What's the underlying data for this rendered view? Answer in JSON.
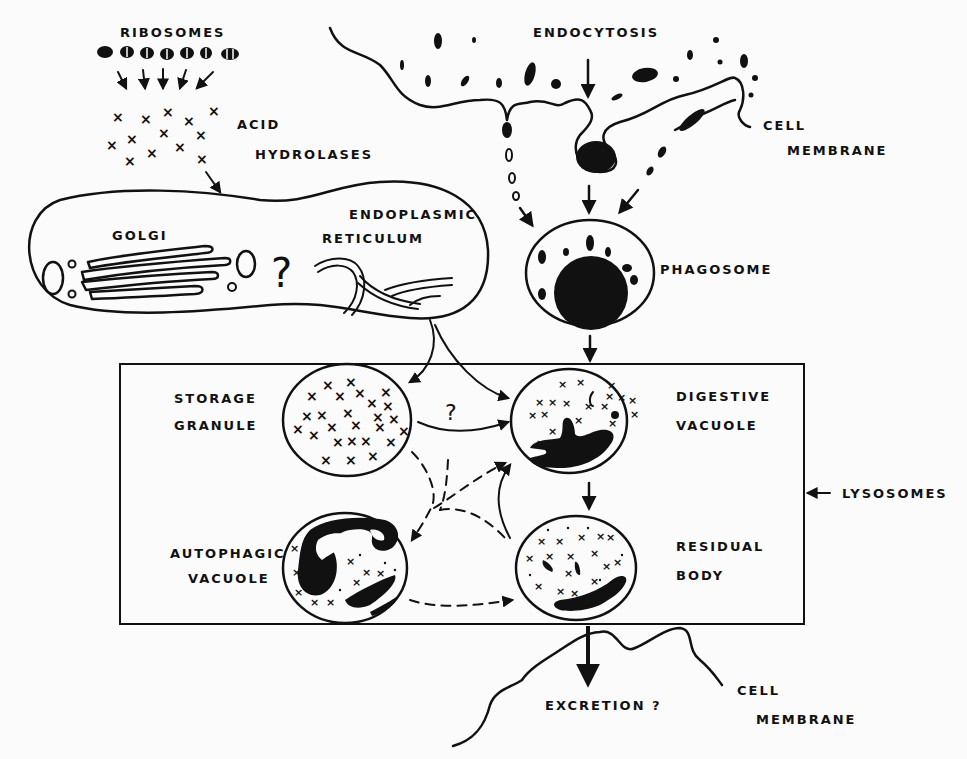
{
  "labels": {
    "ribosomes": "RIBOSOMES",
    "acid": "ACID",
    "hydrolases": "HYDROLASES",
    "golgi": "GOLGI",
    "endoplasmic": "ENDOPLASMIC",
    "reticulum": "RETICULUM",
    "endocytosis": "ENDOCYTOSIS",
    "cell_top": "CELL",
    "membrane_top": "MEMBRANE",
    "phagosome": "PHAGOSOME",
    "storage": "STORAGE",
    "granule": "GRANULE",
    "digestive": "DIGESTIVE",
    "vacuole_d": "VACUOLE",
    "autophagic": "AUTOPHAGIC",
    "vacuole_a": "VACUOLE",
    "residual": "RESIDUAL",
    "body": "BODY",
    "lysosomes": "LYSOSOMES",
    "excretion": "EXCRETION ?",
    "cell_bottom": "CELL",
    "membrane_bottom": "MEMBRANE",
    "q_golgi_er": "?",
    "q_storage": "?"
  },
  "colors": {
    "ink": "#111111",
    "paper": "#fbfbfb"
  }
}
